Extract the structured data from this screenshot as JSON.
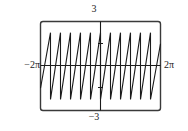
{
  "chart_data": {
    "type": "line",
    "title": "",
    "subtitle": "",
    "xlabel": "",
    "ylabel": "",
    "grid": false,
    "legend": null,
    "wave": "sawtooth",
    "cycles": 6,
    "amplitude": 3,
    "xlim": [
      -6.283185307179586,
      6.283185307179586
    ],
    "ylim": [
      -3,
      3
    ],
    "axis_labels": {
      "x_min": "−2π",
      "x_max": "2π",
      "y_max": "3",
      "y_min": "−3"
    },
    "tick_values": {
      "x": [
        -6.283185307179586,
        6.283185307179586
      ],
      "y": [
        -3,
        3
      ]
    },
    "series": [
      {
        "name": "sawtooth",
        "description": "Sawtooth wave with gradual linear rise and sharp vertical fall, 6 periods across the window",
        "x": [
          -6.2832,
          -5.236,
          -5.236,
          -4.1888,
          -4.1888,
          -3.1416,
          -3.1416,
          -2.0944,
          -2.0944,
          -1.0472,
          -1.0472,
          0.0,
          0.0,
          1.0472,
          1.0472,
          2.0944,
          2.0944,
          3.1416,
          3.1416,
          4.1888,
          4.1888,
          5.236,
          5.236,
          6.2832
        ],
        "y": [
          -1.5,
          2.25,
          -2.25,
          2.25,
          -2.25,
          2.25,
          -2.25,
          2.25,
          -2.25,
          2.25,
          -2.25,
          2.25,
          -2.25,
          2.25,
          -2.25,
          2.25,
          -2.25,
          2.25,
          -2.25,
          2.25,
          -2.25,
          2.25,
          -2.25,
          1.5
        ]
      }
    ],
    "colors": {
      "curve": "#1a1a1a",
      "axis": "#1a1a1a",
      "frame": "#3a3a3a",
      "background": "#ffffff"
    }
  }
}
